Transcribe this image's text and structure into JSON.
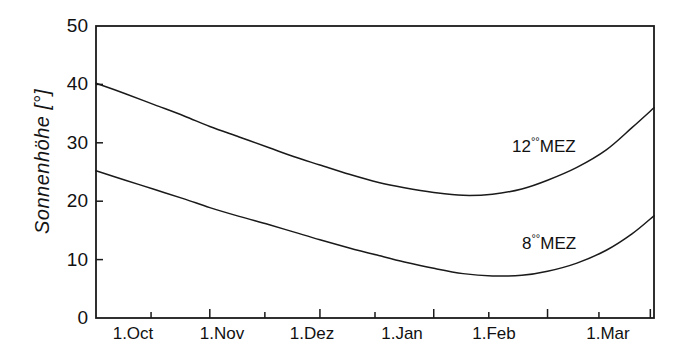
{
  "chart_data": {
    "type": "line",
    "title": "",
    "xlabel": "",
    "ylabel": "Sonnenhöhe [°]",
    "ylim": [
      0,
      50
    ],
    "yticks": [
      "0",
      "10",
      "20",
      "30",
      "40",
      "50"
    ],
    "ytick_values": [
      0,
      10,
      20,
      30,
      40,
      50
    ],
    "categories": [
      "1.Oct",
      "1.Nov",
      "1.Dez",
      "1.Jan",
      "1.Feb",
      "1.Mar"
    ],
    "xtick_labels": [
      "1.Oct",
      "1.Nov",
      "1.Dez",
      "1.Jan",
      "1.Feb",
      "1.Mar"
    ],
    "xlim": [
      0,
      152
    ],
    "x_unit": "days from 1 October",
    "grid": false,
    "legend_position": "inline-right",
    "minor_ticks": true,
    "frame": "box",
    "line_color": "#1a1a1a",
    "background_color": "#ffffff",
    "series": [
      {
        "name": "12°°MEZ",
        "label_main": "12",
        "label_sup": "°°",
        "label_tail": "MEZ",
        "x": [
          0,
          8,
          16,
          24,
          31,
          39,
          47,
          54,
          61,
          69,
          77,
          84,
          92,
          100,
          108,
          116,
          123,
          131,
          139,
          146,
          152
        ],
        "values": [
          40.2,
          38.4,
          36.5,
          34.6,
          32.8,
          31.0,
          29.2,
          27.6,
          26.2,
          24.6,
          23.2,
          22.3,
          21.5,
          21.0,
          21.2,
          22.1,
          23.6,
          25.8,
          28.8,
          32.6,
          36.0
        ]
      },
      {
        "name": "8°°MEZ",
        "label_main": "8",
        "label_sup": "°°",
        "label_tail": "MEZ",
        "x": [
          0,
          8,
          16,
          24,
          31,
          39,
          47,
          54,
          61,
          69,
          77,
          84,
          92,
          100,
          108,
          116,
          123,
          131,
          139,
          146,
          152
        ],
        "values": [
          25.2,
          23.6,
          22.0,
          20.4,
          18.9,
          17.4,
          16.0,
          14.7,
          13.4,
          12.0,
          10.7,
          9.6,
          8.5,
          7.6,
          7.2,
          7.3,
          8.0,
          9.4,
          11.6,
          14.4,
          17.5
        ]
      }
    ],
    "annotations": [
      {
        "text": "12°°MEZ",
        "x": 118,
        "y": 31
      },
      {
        "text": "8°°MEZ",
        "x": 122,
        "y": 15
      }
    ]
  }
}
